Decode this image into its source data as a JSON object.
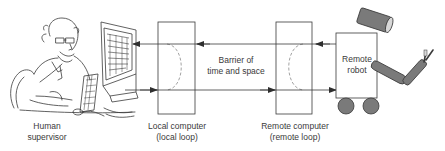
{
  "diagram": {
    "nodes": [
      {
        "id": "human",
        "label_line1": "Human",
        "label_line2": "supervisor"
      },
      {
        "id": "local",
        "label_line1": "Local computer",
        "label_line2": "(local loop)"
      },
      {
        "id": "remote",
        "label_line1": "Remote computer",
        "label_line2": "(remote loop)"
      },
      {
        "id": "robot",
        "label_line1": "Remote",
        "label_line2": "robot"
      }
    ],
    "barrier": {
      "line1": "Barrier of",
      "line2": "time and space"
    },
    "edges": [
      {
        "from": "robot",
        "to": "human",
        "direction": "leftward",
        "path": "top"
      },
      {
        "from": "human",
        "to": "robot",
        "direction": "rightward",
        "path": "bottom"
      }
    ],
    "icons": {
      "human": "person-at-computer-icon",
      "robot": "mobile-robot-icon"
    },
    "colors": {
      "line": "#3a3a3a",
      "robot_fill": "#7a7a7a",
      "dashed": "#8a8a8a",
      "background": "#ffffff"
    }
  }
}
